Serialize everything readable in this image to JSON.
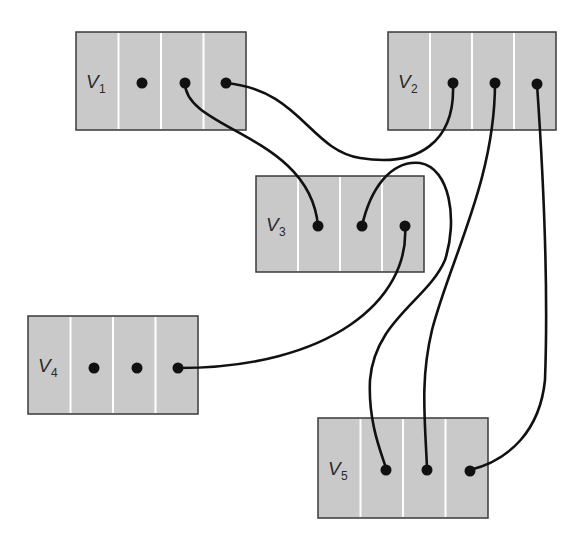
{
  "diagram": {
    "type": "pointer-record-graph",
    "background": "#ffffff",
    "box_fill": "#c9c9c9",
    "line_color": "#111111",
    "nodes": [
      {
        "id": "V1",
        "label": "V",
        "subscript": "1",
        "x": 76,
        "y": 32,
        "w": 170,
        "h": 98,
        "cells": 4
      },
      {
        "id": "V2",
        "label": "V",
        "subscript": "2",
        "x": 388,
        "y": 32,
        "w": 168,
        "h": 98,
        "cells": 4
      },
      {
        "id": "V3",
        "label": "V",
        "subscript": "3",
        "x": 256,
        "y": 176,
        "w": 168,
        "h": 96,
        "cells": 4
      },
      {
        "id": "V4",
        "label": "V",
        "subscript": "4",
        "x": 28,
        "y": 316,
        "w": 170,
        "h": 98,
        "cells": 4
      },
      {
        "id": "V5",
        "label": "V",
        "subscript": "5",
        "x": 318,
        "y": 418,
        "w": 170,
        "h": 100,
        "cells": 4
      }
    ],
    "edges": [
      {
        "from": "V1.cell2",
        "to": "V3.cell1",
        "path": "M185,83 C185,130 310,135 318,226"
      },
      {
        "from": "V1.cell3",
        "to": "V2.cell1",
        "path": "M226,83 C300,90 310,150 360,158 C420,168 455,140 453,85"
      },
      {
        "from": "V2.cell2",
        "to": "V5.cell2",
        "path": "M495,83 C495,180 450,260 432,330 C420,380 425,420 427,468"
      },
      {
        "from": "V2.cell3",
        "to": "V5.cell3",
        "path": "M537,84 C545,200 548,300 545,380 C540,430 510,460 470,470"
      },
      {
        "from": "V3.cell2",
        "to": "V5.cell1",
        "path": "M362,226 C370,190 390,160 420,163 C450,168 458,220 445,260 C428,300 375,320 370,380 C368,420 380,450 386,468"
      },
      {
        "from": "V3.cell3",
        "to": "V4.cell3",
        "path": "M405,226 C410,300 330,368 178,368"
      }
    ],
    "dots": [
      {
        "node": "V1",
        "cell": 1,
        "x": 142,
        "y": 83
      },
      {
        "node": "V1",
        "cell": 2,
        "x": 185,
        "y": 83
      },
      {
        "node": "V1",
        "cell": 3,
        "x": 226,
        "y": 83
      },
      {
        "node": "V2",
        "cell": 1,
        "x": 453,
        "y": 83
      },
      {
        "node": "V2",
        "cell": 2,
        "x": 495,
        "y": 83
      },
      {
        "node": "V2",
        "cell": 3,
        "x": 537,
        "y": 84
      },
      {
        "node": "V3",
        "cell": 1,
        "x": 318,
        "y": 226
      },
      {
        "node": "V3",
        "cell": 2,
        "x": 362,
        "y": 226
      },
      {
        "node": "V3",
        "cell": 3,
        "x": 405,
        "y": 226
      },
      {
        "node": "V4",
        "cell": 1,
        "x": 94,
        "y": 368
      },
      {
        "node": "V4",
        "cell": 2,
        "x": 137,
        "y": 368
      },
      {
        "node": "V4",
        "cell": 3,
        "x": 178,
        "y": 368
      },
      {
        "node": "V5",
        "cell": 1,
        "x": 386,
        "y": 470
      },
      {
        "node": "V5",
        "cell": 2,
        "x": 427,
        "y": 470
      },
      {
        "node": "V5",
        "cell": 3,
        "x": 470,
        "y": 471
      }
    ]
  }
}
